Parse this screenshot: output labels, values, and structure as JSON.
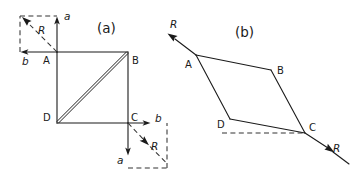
{
  "figure": {
    "background_color": "#ffffff",
    "ink_color": "#1a1a1a",
    "panels": [
      {
        "id": "panel-a",
        "label": "(a)",
        "x": 97,
        "y": 31
      },
      {
        "id": "panel-b",
        "label": "(b)",
        "x": 236,
        "y": 36
      }
    ]
  },
  "panel_a": {
    "square": {
      "vertices": [
        {
          "name": "A",
          "label": "A",
          "x": 57,
          "y": 52,
          "label_x": 43,
          "label_y": 64
        },
        {
          "name": "B",
          "label": "B",
          "x": 128,
          "y": 52,
          "label_x": 132,
          "label_y": 64
        },
        {
          "name": "C",
          "label": "C",
          "x": 128,
          "y": 123,
          "label_x": 131,
          "label_y": 121
        },
        {
          "name": "D",
          "label": "D",
          "x": 57,
          "y": 123,
          "label_x": 43,
          "label_y": 121
        }
      ],
      "diagonal": {
        "from": "D",
        "to": "B",
        "style": "double-line"
      }
    },
    "vector_box_top_left": {
      "origin": "A",
      "dashed_rect": {
        "x": 20,
        "y": 16,
        "width": 37,
        "height": 36
      },
      "vectors": [
        {
          "name": "a",
          "label": "a",
          "direction": "up",
          "tip_x": 57,
          "tip_y": 17,
          "label_x": 64,
          "label_y": 18
        },
        {
          "name": "b",
          "label": "b",
          "direction": "left",
          "tip_x": 21,
          "tip_y": 52,
          "label_x": 23,
          "label_y": 64
        },
        {
          "name": "R",
          "label": "R",
          "direction": "up-left-resultant",
          "tip_x": 22,
          "tip_y": 18,
          "label_x": 38,
          "label_y": 33
        }
      ]
    },
    "vector_box_bottom_right": {
      "origin": "C",
      "dashed_rect": {
        "x": 128,
        "y": 123,
        "width": 39,
        "height": 45
      },
      "vectors": [
        {
          "name": "b",
          "label": "b",
          "direction": "right",
          "tip_x": 150,
          "tip_y": 123,
          "label_x": 156,
          "label_y": 121
        },
        {
          "name": "a",
          "label": "a",
          "direction": "down",
          "tip_x": 128,
          "tip_y": 155,
          "label_x": 119,
          "label_y": 163
        },
        {
          "name": "R",
          "label": "R",
          "direction": "down-right-resultant",
          "tip_x": 147,
          "tip_y": 144,
          "label_x": 152,
          "label_y": 148
        }
      ]
    }
  },
  "panel_b": {
    "parallelogram": {
      "vertices": [
        {
          "name": "A",
          "label": "A",
          "x": 196,
          "y": 55,
          "label_x": 186,
          "label_y": 66
        },
        {
          "name": "B",
          "label": "B",
          "x": 271,
          "y": 70,
          "label_x": 277,
          "label_y": 73
        },
        {
          "name": "C",
          "label": "C",
          "x": 305,
          "y": 133,
          "label_x": 309,
          "label_y": 131
        },
        {
          "name": "D",
          "label": "D",
          "x": 230,
          "y": 119,
          "label_x": 218,
          "label_y": 127
        }
      ]
    },
    "dashed_baseline": {
      "from_x": 222,
      "from_y": 133,
      "to_x": 303,
      "to_y": 133
    },
    "resultant_upper": {
      "label": "R",
      "from_x": 196,
      "from_y": 55,
      "tip_x": 168,
      "tip_y": 34,
      "label_x": 172,
      "label_y": 27
    },
    "resultant_lower": {
      "label": "R",
      "from_x": 305,
      "from_y": 133,
      "tip_x": 333,
      "tip_y": 152,
      "tail_end_x": 349,
      "tail_end_y": 164,
      "label_x": 333,
      "label_y": 150
    }
  }
}
